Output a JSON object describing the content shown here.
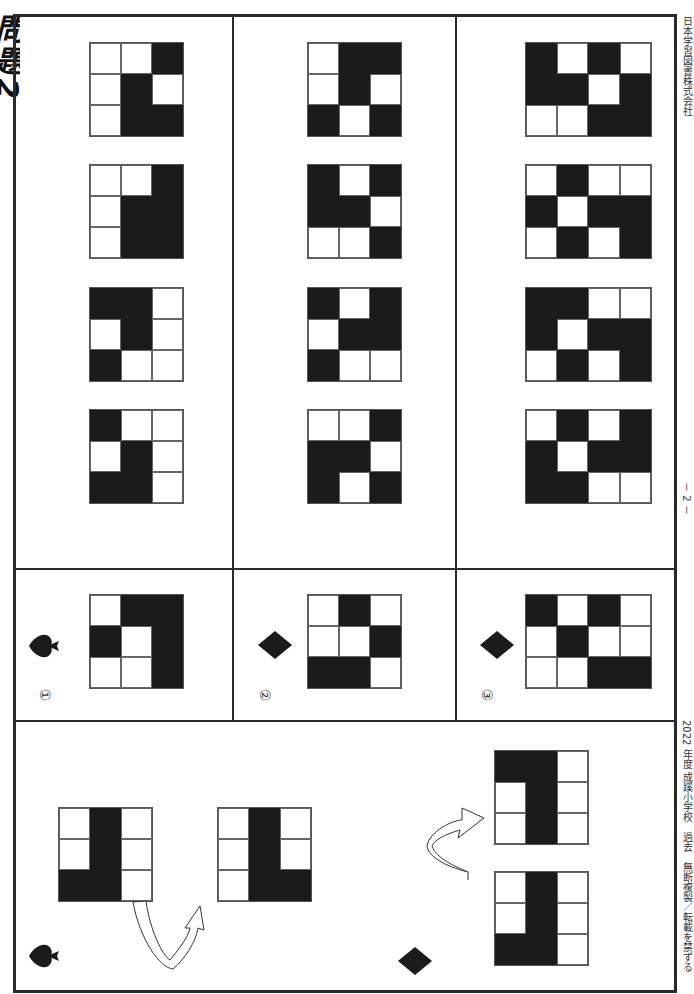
{
  "page": {
    "title": "問題2",
    "publisher": "日本学習図書株式会社",
    "page_number": "－ 2 －",
    "copyright_line": "2022 年度 成蹊小学校　過去　無断複製／転載を禁ずる"
  },
  "example": {
    "spade": {
      "symbol": "spade-icon",
      "before": [
        [
          "W",
          "B",
          "W"
        ],
        [
          "W",
          "B",
          "W"
        ],
        [
          "B",
          "B",
          "W"
        ]
      ],
      "after": [
        [
          "W",
          "B",
          "W"
        ],
        [
          "W",
          "B",
          "W"
        ],
        [
          "W",
          "B",
          "B"
        ]
      ]
    },
    "diamond": {
      "symbol": "diamond-icon",
      "before": [
        [
          "W",
          "B",
          "W"
        ],
        [
          "W",
          "B",
          "W"
        ],
        [
          "B",
          "B",
          "W"
        ]
      ],
      "after": [
        [
          "B",
          "B",
          "W"
        ],
        [
          "W",
          "B",
          "W"
        ],
        [
          "W",
          "B",
          "W"
        ]
      ]
    }
  },
  "questions": [
    {
      "label": "①",
      "symbol": "spade-icon",
      "given": [
        [
          "W",
          "B",
          "B"
        ],
        [
          "B",
          "W",
          "B"
        ],
        [
          "W",
          "W",
          "B"
        ]
      ],
      "choices": [
        [
          [
            "W",
            "W",
            "B"
          ],
          [
            "W",
            "B",
            "W"
          ],
          [
            "W",
            "B",
            "B"
          ]
        ],
        [
          [
            "W",
            "W",
            "B"
          ],
          [
            "W",
            "B",
            "B"
          ],
          [
            "W",
            "B",
            "B"
          ]
        ],
        [
          [
            "B",
            "B",
            "W"
          ],
          [
            "W",
            "B",
            "W"
          ],
          [
            "B",
            "W",
            "W"
          ]
        ],
        [
          [
            "B",
            "W",
            "W"
          ],
          [
            "W",
            "B",
            "W"
          ],
          [
            "B",
            "B",
            "W"
          ]
        ]
      ]
    },
    {
      "label": "②",
      "symbol": "diamond-icon",
      "given": [
        [
          "W",
          "B",
          "W"
        ],
        [
          "W",
          "W",
          "B"
        ],
        [
          "B",
          "B",
          "W"
        ]
      ],
      "choices": [
        [
          [
            "W",
            "B",
            "B"
          ],
          [
            "W",
            "B",
            "W"
          ],
          [
            "B",
            "W",
            "B"
          ]
        ],
        [
          [
            "B",
            "W",
            "B"
          ],
          [
            "B",
            "B",
            "W"
          ],
          [
            "W",
            "W",
            "B"
          ]
        ],
        [
          [
            "B",
            "W",
            "B"
          ],
          [
            "W",
            "B",
            "B"
          ],
          [
            "B",
            "W",
            "W"
          ]
        ],
        [
          [
            "W",
            "W",
            "B"
          ],
          [
            "B",
            "B",
            "W"
          ],
          [
            "B",
            "W",
            "B"
          ]
        ]
      ]
    },
    {
      "label": "③",
      "symbol": "diamond-icon",
      "given": [
        [
          "B",
          "W",
          "B",
          "W"
        ],
        [
          "W",
          "B",
          "W",
          "W"
        ],
        [
          "W",
          "W",
          "B",
          "B"
        ]
      ],
      "choices": [
        [
          [
            "B",
            "W",
            "B",
            "W"
          ],
          [
            "B",
            "B",
            "W",
            "B"
          ],
          [
            "W",
            "W",
            "B",
            "B"
          ]
        ],
        [
          [
            "W",
            "B",
            "W",
            "W"
          ],
          [
            "B",
            "W",
            "B",
            "B"
          ],
          [
            "W",
            "B",
            "W",
            "B"
          ]
        ],
        [
          [
            "B",
            "B",
            "W",
            "W"
          ],
          [
            "B",
            "W",
            "B",
            "B"
          ],
          [
            "W",
            "B",
            "W",
            "B"
          ]
        ],
        [
          [
            "W",
            "B",
            "W",
            "B"
          ],
          [
            "B",
            "W",
            "B",
            "B"
          ],
          [
            "B",
            "B",
            "W",
            "W"
          ]
        ]
      ]
    }
  ],
  "colors": {
    "black_cell": "#1b1b1b",
    "white_cell": "#ffffff",
    "line": "#2a2a2a"
  }
}
